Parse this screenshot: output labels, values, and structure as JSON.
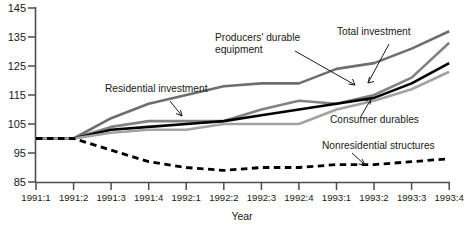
{
  "chart_data": {
    "type": "line",
    "title": "",
    "xlabel": "Year",
    "ylabel": "",
    "ylim": [
      85,
      145
    ],
    "yticks": [
      85,
      95,
      105,
      115,
      125,
      135,
      145
    ],
    "grid": false,
    "legend": "annotations-inline",
    "categories": [
      "1991:1",
      "1991:2",
      "1991:3",
      "1991:4",
      "1992:1",
      "1992:2",
      "1992:3",
      "1992:4",
      "1993:1",
      "1993:2",
      "1993:3",
      "1993:4"
    ],
    "series": [
      {
        "name": "Residential investment",
        "color": "#6e6e6e",
        "style": "solid",
        "values": [
          100,
          100,
          107,
          112,
          115,
          118,
          119,
          119,
          124,
          126,
          131,
          137
        ]
      },
      {
        "name": "Producers' durable equipment",
        "color": "#828282",
        "style": "solid",
        "values": [
          100,
          100,
          104,
          106,
          106,
          106,
          110,
          113,
          112,
          115,
          121,
          133
        ]
      },
      {
        "name": "Total investment",
        "color": "#000000",
        "style": "solid",
        "values": [
          100,
          100,
          103,
          104,
          105,
          106,
          108,
          110,
          112,
          114,
          119,
          126
        ]
      },
      {
        "name": "Consumer durables",
        "color": "#a3a3a3",
        "style": "solid",
        "values": [
          100,
          100,
          102,
          103,
          103,
          105,
          105,
          105,
          110,
          113,
          117,
          123
        ]
      },
      {
        "name": "Nonresidential structures",
        "color": "#000000",
        "style": "dashed",
        "values": [
          100,
          100,
          96,
          92,
          90,
          89,
          90,
          90,
          91,
          91,
          92,
          93
        ]
      }
    ],
    "annotations": [
      {
        "text": "Residential investment",
        "series": "Residential investment"
      },
      {
        "text": "Producers' durable",
        "series": "Producers' durable equipment"
      },
      {
        "text": "equipment",
        "series": "Producers' durable equipment"
      },
      {
        "text": "Total investment",
        "series": "Total investment"
      },
      {
        "text": "Consumer durables",
        "series": "Consumer durables"
      },
      {
        "text": "Nonresidential structures",
        "series": "Nonresidential structures"
      }
    ]
  },
  "axis": {
    "y_labels": [
      "145",
      "135",
      "125",
      "115",
      "105",
      "95",
      "85"
    ],
    "x_labels": [
      "1991:1",
      "1991:2",
      "1991:3",
      "1991:4",
      "1992:1",
      "1992:2",
      "1992:3",
      "1992:4",
      "1993:1",
      "1993:2",
      "1993:3",
      "1993:4"
    ],
    "x_title": "Year"
  },
  "labels": {
    "residential": "Residential investment",
    "pde_line1": "Producers' durable",
    "pde_line2": "equipment",
    "total": "Total investment",
    "consumer": "Consumer durables",
    "nonresidential": "Nonresidential structures"
  }
}
